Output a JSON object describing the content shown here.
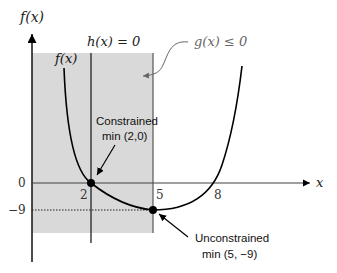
{
  "diagram": {
    "y_axis_label": "f(x)",
    "x_axis_label": "x",
    "curve_label": "f(x)",
    "equality_constraint_label": "h(x) = 0",
    "inequality_constraint_label": "g(x) ≤ 0",
    "x_ticks": [
      "2",
      "5",
      "8"
    ],
    "y_ticks": [
      "0",
      "−9"
    ],
    "constrained_min": {
      "title": "Constrained",
      "value": "min (2,0)"
    },
    "unconstrained_min": {
      "title": "Unconstrained",
      "value": "min (5, −9)"
    },
    "colors": {
      "shade": "#d9d9d9",
      "axis": "#404040",
      "curve": "#000000",
      "callout": "#666666"
    }
  }
}
